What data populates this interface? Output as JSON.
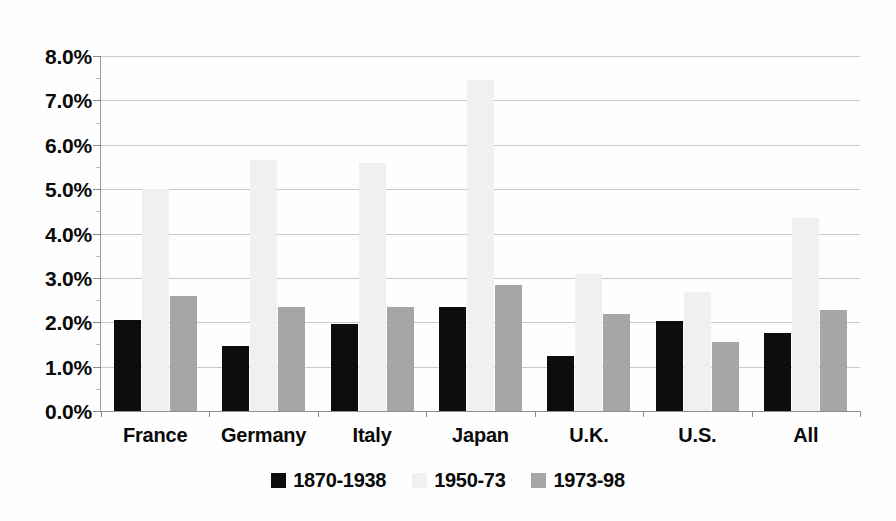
{
  "chart_data": {
    "type": "bar",
    "title": "",
    "subtitle": "",
    "xlabel": "",
    "ylabel": "",
    "categories": [
      "France",
      "Germany",
      "Italy",
      "Japan",
      "U.K.",
      "U.S.",
      "All"
    ],
    "series": [
      {
        "name": "1870-1938",
        "color": "#0d0d0d",
        "values": [
          2.05,
          1.47,
          1.95,
          2.35,
          1.24,
          2.02,
          1.75
        ]
      },
      {
        "name": "1950-73",
        "color": "#f0f0f0",
        "values": [
          5.0,
          5.65,
          5.6,
          7.45,
          3.08,
          2.68,
          4.35
        ]
      },
      {
        "name": "1973-98",
        "color": "#a6a6a6",
        "values": [
          2.6,
          2.35,
          2.35,
          2.83,
          2.18,
          1.55,
          2.27
        ]
      }
    ],
    "ylim": [
      0.0,
      8.0
    ],
    "ytick_values": [
      0.0,
      1.0,
      2.0,
      3.0,
      4.0,
      5.0,
      6.0,
      7.0,
      8.0
    ],
    "ytick_labels": [
      "0.0%",
      "1.0%",
      "2.0%",
      "3.0%",
      "4.0%",
      "5.0%",
      "6.0%",
      "7.0%",
      "8.0%"
    ],
    "value_unit": "%",
    "grid": true,
    "grid_axis": "y",
    "legend_position": "bottom",
    "orientation": "vertical",
    "background_color": "#ffffff",
    "gridline_color": "#c9c9c9",
    "axis_color": "#8a8a8a",
    "text_color": "#0a0a0a"
  }
}
